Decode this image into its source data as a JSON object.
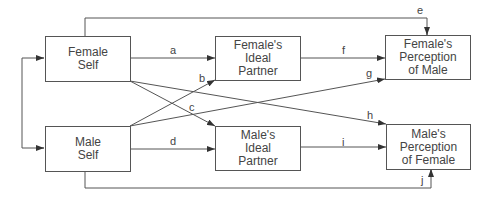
{
  "nodes": {
    "female_self": "Female\nSelf",
    "male_self": "Male\nSelf",
    "female_ideal": "Female's\nIdeal\nPartner",
    "male_ideal": "Male's\nIdeal\nPartner",
    "female_perception": "Female's\nPerception\nof Male",
    "male_perception": "Male's\nPerception\nof Female"
  },
  "edges": [
    {
      "label": "a",
      "from": "Female Self",
      "to": "Female's Ideal Partner"
    },
    {
      "label": "b",
      "from": "Male Self",
      "to": "Female's Ideal Partner"
    },
    {
      "label": "c",
      "from": "Female Self",
      "to": "Male's Ideal Partner"
    },
    {
      "label": "d",
      "from": "Male Self",
      "to": "Male's Ideal Partner"
    },
    {
      "label": "e",
      "from": "Female Self",
      "to": "Female's Perception of Male"
    },
    {
      "label": "f",
      "from": "Female's Ideal Partner",
      "to": "Female's Perception of Male"
    },
    {
      "label": "g",
      "from": "Male Self",
      "to": "Female's Perception of Male"
    },
    {
      "label": "h",
      "from": "Female Self",
      "to": "Male's Perception of Female"
    },
    {
      "label": "i",
      "from": "Male's Ideal Partner",
      "to": "Male's Perception of Female"
    },
    {
      "label": "j",
      "from": "Male Self",
      "to": "Male's Perception of Female"
    }
  ],
  "colors": {
    "line": "#444444",
    "box_border": "#555555",
    "text": "#444444"
  }
}
